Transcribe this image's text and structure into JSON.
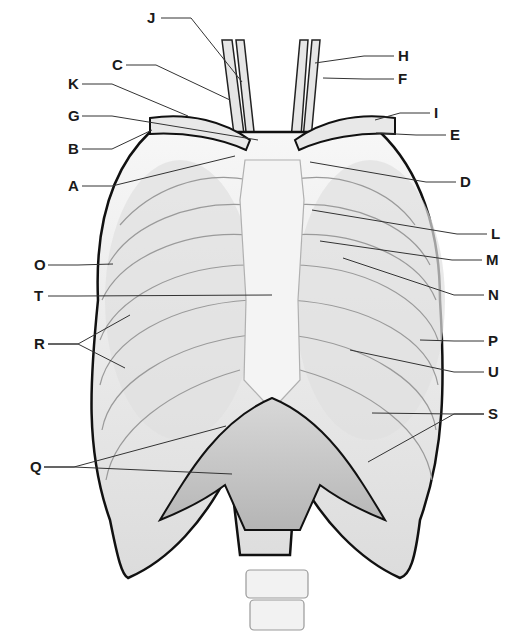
{
  "colors": {
    "outline": "#111111",
    "bone": "#f2f2f2",
    "shade": "#c9c9c9",
    "muscle": "#b8b8b8",
    "leader": "#333333"
  },
  "labels": [
    {
      "id": "J",
      "text": "J",
      "x": 147,
      "y": 10,
      "tx": 242,
      "ty": 82
    },
    {
      "id": "C",
      "text": "C",
      "x": 112,
      "y": 57,
      "tx": 230,
      "ty": 100
    },
    {
      "id": "K",
      "text": "K",
      "x": 68,
      "y": 76,
      "tx": 188,
      "ty": 116
    },
    {
      "id": "G",
      "text": "G",
      "x": 68,
      "y": 108,
      "tx": 258,
      "ty": 140
    },
    {
      "id": "B",
      "text": "B",
      "x": 68,
      "y": 141,
      "tx": 152,
      "ty": 130
    },
    {
      "id": "A",
      "text": "A",
      "x": 68,
      "y": 178,
      "tx": 235,
      "ty": 156
    },
    {
      "id": "H",
      "text": "H",
      "x": 398,
      "y": 48,
      "tx": 315,
      "ty": 63
    },
    {
      "id": "F",
      "text": "F",
      "x": 398,
      "y": 71,
      "tx": 323,
      "ty": 78
    },
    {
      "id": "I",
      "text": "I",
      "x": 434,
      "y": 105,
      "tx": 375,
      "ty": 120
    },
    {
      "id": "E",
      "text": "E",
      "x": 450,
      "y": 127,
      "tx": 376,
      "ty": 133
    },
    {
      "id": "D",
      "text": "D",
      "x": 460,
      "y": 174,
      "tx": 310,
      "ty": 162
    },
    {
      "id": "L",
      "text": "L",
      "x": 491,
      "y": 226,
      "tx": 312,
      "ty": 210
    },
    {
      "id": "M",
      "text": "M",
      "x": 486,
      "y": 252,
      "tx": 320,
      "ty": 241
    },
    {
      "id": "N",
      "text": "N",
      "x": 488,
      "y": 287,
      "tx": 343,
      "ty": 258
    },
    {
      "id": "O",
      "text": "O",
      "x": 34,
      "y": 257,
      "tx": 113,
      "ty": 264
    },
    {
      "id": "T",
      "text": "T",
      "x": 34,
      "y": 288,
      "tx": 272,
      "ty": 295
    },
    {
      "id": "P",
      "text": "P",
      "x": 488,
      "y": 333,
      "tx": 420,
      "ty": 340
    },
    {
      "id": "R",
      "text": "R",
      "x": 34,
      "y": 336,
      "tx": 130,
      "ty": 315,
      "tx2": 125,
      "ty2": 368
    },
    {
      "id": "U",
      "text": "U",
      "x": 488,
      "y": 364,
      "tx": 350,
      "ty": 350
    },
    {
      "id": "S",
      "text": "S",
      "x": 488,
      "y": 406,
      "tx": 372,
      "ty": 413,
      "tx2": 368,
      "ty2": 462
    },
    {
      "id": "Q",
      "text": "Q",
      "x": 30,
      "y": 459,
      "tx": 226,
      "ty": 426,
      "tx2": 232,
      "ty2": 474
    }
  ]
}
